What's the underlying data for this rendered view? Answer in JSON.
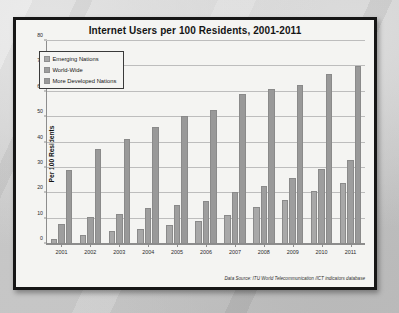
{
  "chart_data": {
    "type": "bar",
    "title": "Internet Users per 100 Residents, 2001-2011",
    "xlabel": "",
    "ylabel": "Per 100 Residents",
    "ylim": [
      0,
      80
    ],
    "ytick_step": 10,
    "yticks": [
      "0",
      "10",
      "20",
      "30",
      "40",
      "50",
      "60",
      "70",
      "80"
    ],
    "grid": true,
    "legend_position": "upper-left",
    "categories": [
      "2001",
      "2002",
      "2003",
      "2004",
      "2005",
      "2006",
      "2007",
      "2008",
      "2009",
      "2010",
      "2011"
    ],
    "series": [
      {
        "name": "Emerging Nations",
        "color": "#a8a8a8",
        "values": [
          2,
          3.5,
          5,
          6,
          7.5,
          9,
          11.5,
          14.5,
          17.5,
          21,
          24
        ]
      },
      {
        "name": "World-Wide",
        "color": "#9e9e9e",
        "values": [
          8,
          10.5,
          12,
          14,
          15.5,
          17,
          20.5,
          23,
          26,
          29.5,
          33
        ]
      },
      {
        "name": "More Developed Nations",
        "color": "#999999",
        "values": [
          29,
          37.5,
          41.5,
          46,
          50.5,
          53,
          59,
          61,
          62.5,
          67,
          70
        ]
      }
    ],
    "source_note": "Data Source: ITU World Telecommunication /ICT indicators database"
  }
}
